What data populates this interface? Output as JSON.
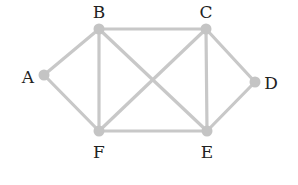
{
  "diagram": {
    "type": "undirected-graph",
    "nodes": [
      {
        "id": "A",
        "label": "A",
        "x": 44,
        "y": 75,
        "lx": 28,
        "ly": 83
      },
      {
        "id": "B",
        "label": "B",
        "x": 99,
        "y": 29,
        "lx": 99,
        "ly": 18
      },
      {
        "id": "C",
        "label": "C",
        "x": 206,
        "y": 29,
        "lx": 206,
        "ly": 18
      },
      {
        "id": "D",
        "label": "D",
        "x": 255,
        "y": 82,
        "lx": 271,
        "ly": 89
      },
      {
        "id": "E",
        "label": "E",
        "x": 207,
        "y": 131,
        "lx": 207,
        "ly": 158
      },
      {
        "id": "F",
        "label": "F",
        "x": 99,
        "y": 131,
        "lx": 99,
        "ly": 158
      }
    ],
    "edges": [
      [
        "A",
        "B"
      ],
      [
        "A",
        "F"
      ],
      [
        "B",
        "C"
      ],
      [
        "B",
        "F"
      ],
      [
        "B",
        "E"
      ],
      [
        "C",
        "F"
      ],
      [
        "C",
        "E"
      ],
      [
        "C",
        "D"
      ],
      [
        "D",
        "E"
      ],
      [
        "F",
        "E"
      ]
    ],
    "colors": {
      "edge": "#c8c8c8",
      "node": "#c4c4c4",
      "label": "#222222"
    }
  }
}
